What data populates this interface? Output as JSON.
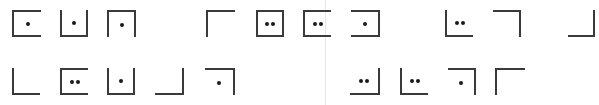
{
  "document": {
    "description": "Row of pigpen-cipher style bracket glyphs with dots",
    "rows": [
      {
        "y": 10,
        "height": 27,
        "glyphs": [
          {
            "x": 12,
            "w": 29,
            "sides": "tlb",
            "dots": 1
          },
          {
            "x": 60,
            "w": 28,
            "sides": "lbr",
            "dots": 1
          },
          {
            "x": 107,
            "w": 29,
            "sides": "ltr",
            "dots": 1
          },
          {
            "x": 206,
            "w": 29,
            "sides": "tl",
            "dots": 0
          },
          {
            "x": 256,
            "w": 28,
            "sides": "tlbr",
            "dots": 2
          },
          {
            "x": 303,
            "w": 28,
            "sides": "tlb",
            "dots": 2
          },
          {
            "x": 351,
            "w": 29,
            "sides": "trb",
            "dots": 1
          },
          {
            "x": 445,
            "w": 28,
            "sides": "lb",
            "dots": 2
          },
          {
            "x": 493,
            "w": 28,
            "sides": "tr",
            "dots": 0
          },
          {
            "x": 568,
            "w": 27,
            "sides": "rb",
            "dots": 0
          }
        ]
      },
      {
        "y": 68,
        "height": 27,
        "glyphs": [
          {
            "x": 12,
            "w": 28,
            "sides": "lb",
            "dots": 0
          },
          {
            "x": 60,
            "w": 28,
            "sides": "tlb",
            "dots": 2
          },
          {
            "x": 107,
            "w": 28,
            "sides": "lbr",
            "dots": 1
          },
          {
            "x": 155,
            "w": 29,
            "sides": "rb",
            "dots": 0
          },
          {
            "x": 205,
            "w": 30,
            "sides": "tr",
            "dots": 1
          },
          {
            "x": 350,
            "w": 30,
            "sides": "rb",
            "dots": 2
          },
          {
            "x": 400,
            "w": 28,
            "sides": "lb",
            "dots": 2
          },
          {
            "x": 448,
            "w": 28,
            "sides": "tr",
            "dots": 1
          },
          {
            "x": 495,
            "w": 30,
            "sides": "tl",
            "dots": 0
          }
        ]
      }
    ],
    "colors": {
      "stroke": "#3a3a3a",
      "dot": "#1a1a1a",
      "background": "#ffffff",
      "gutter": "#e6e6e6"
    }
  }
}
